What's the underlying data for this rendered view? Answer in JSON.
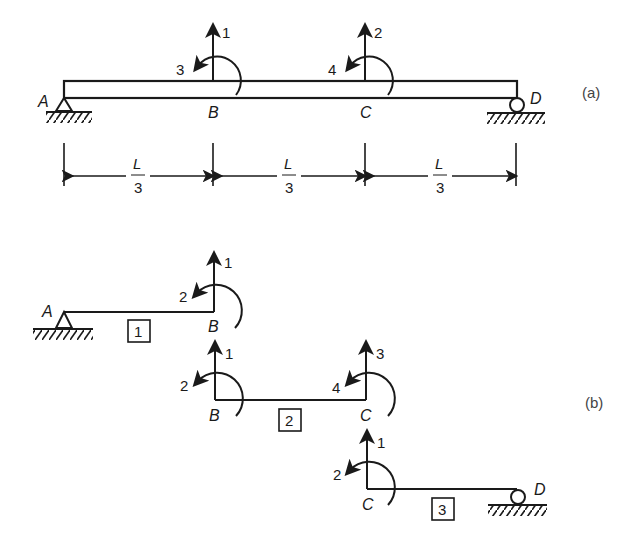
{
  "figure_a": {
    "label": "(a)",
    "nodes": {
      "A": "A",
      "B": "B",
      "C": "C",
      "D": "D"
    },
    "dof_B": {
      "force": "1",
      "moment": "3"
    },
    "dof_C": {
      "force": "2",
      "moment": "4"
    },
    "dimensions": [
      {
        "num": "L",
        "den": "3"
      },
      {
        "num": "L",
        "den": "3"
      },
      {
        "num": "L",
        "den": "3"
      }
    ]
  },
  "figure_b": {
    "label": "(b)",
    "elements": [
      {
        "id": "1",
        "left_node": "A",
        "right_node": "B",
        "right_force": "1",
        "right_moment": "2"
      },
      {
        "id": "2",
        "left_node": "B",
        "right_node": "C",
        "left_force": "1",
        "left_moment": "2",
        "right_force": "3",
        "right_moment": "4"
      },
      {
        "id": "3",
        "left_node": "C",
        "right_node": "D",
        "left_force": "1",
        "left_moment": "2"
      }
    ]
  }
}
